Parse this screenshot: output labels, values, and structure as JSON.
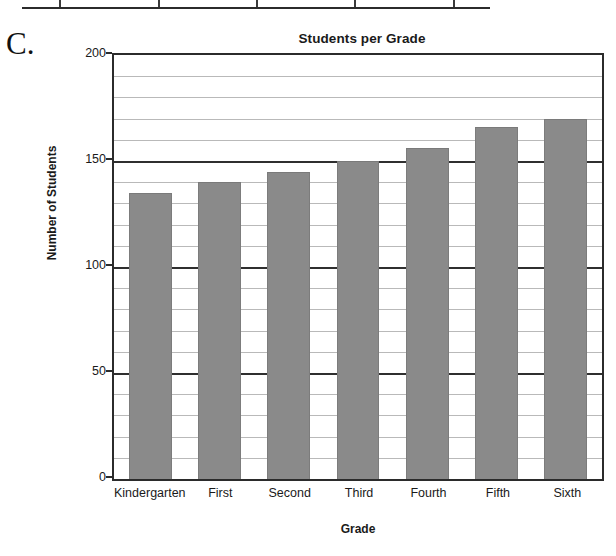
{
  "part_label": "C.",
  "table_fragment": {
    "divider_positions_pct": [
      8,
      29,
      50,
      71,
      92
    ]
  },
  "chart_data": {
    "type": "bar",
    "title": "Students per Grade",
    "xlabel": "Grade",
    "ylabel": "Number of Students",
    "categories": [
      "Kindergarten",
      "First",
      "Second",
      "Third",
      "Fourth",
      "Fifth",
      "Sixth"
    ],
    "values": [
      135,
      140,
      145,
      150,
      156,
      166,
      170
    ],
    "ylim": [
      0,
      200
    ],
    "major_ticks": [
      0,
      50,
      100,
      150,
      200
    ],
    "major_tick_labels": [
      "0",
      "50",
      "100",
      "150",
      "200"
    ],
    "minor_tick_step": 10,
    "grid": true,
    "legend": "none",
    "bar_color": "#8a8a8a",
    "axis_color": "#2b2b2b",
    "gridline_color": "#b9b9b9"
  }
}
